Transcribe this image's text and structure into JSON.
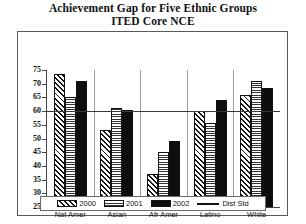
{
  "chart_data": {
    "type": "bar",
    "title": "Achievement Gap for Five Ethnic Groups",
    "subtitle": "ITED Core NCE",
    "xlabel": "",
    "ylabel": "",
    "ylim": [
      25,
      75
    ],
    "ytick_step": 5,
    "yticks": [
      75,
      70,
      65,
      60,
      55,
      50,
      45,
      40,
      35,
      30,
      25
    ],
    "grid": false,
    "legend_position": "bottom",
    "categories": [
      "Nat Amer",
      "Asian",
      "Afr Amer",
      "Latino",
      "White"
    ],
    "series": [
      {
        "name": "2000",
        "pattern": "diagonal-hatch",
        "values": [
          73.5,
          53,
          37,
          60,
          66
        ]
      },
      {
        "name": "2001",
        "pattern": "cross-hatch",
        "values": [
          65,
          61,
          45,
          55.5,
          71
        ]
      },
      {
        "name": "2002",
        "pattern": "solid-black",
        "values": [
          71,
          60.5,
          49,
          64,
          68.5
        ]
      }
    ],
    "reference_line": {
      "name": "Dist Std",
      "value": 60,
      "style": "solid-line"
    }
  },
  "legend": {
    "items": [
      {
        "label": "2000",
        "swatch": "y2000"
      },
      {
        "label": "2001",
        "swatch": "y2001"
      },
      {
        "label": "2002",
        "swatch": "y2002"
      },
      {
        "label": "Dist Std",
        "swatch": "line"
      }
    ]
  }
}
